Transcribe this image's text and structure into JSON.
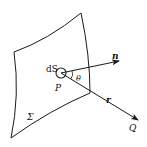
{
  "figure": {
    "labels": {
      "surface_element": "dS",
      "point_p": "P",
      "normal": "n",
      "angle": "θ",
      "vector_r": "r",
      "point_q": "Q",
      "surface": "Σ"
    },
    "colors": {
      "stroke": "#1a1a1a",
      "background": "#ffffff"
    }
  }
}
